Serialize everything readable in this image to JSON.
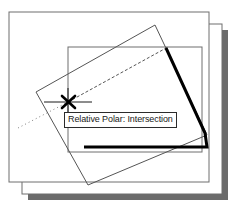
{
  "app": {
    "type": "cad-drawing-canvas",
    "background_color": "#ffffff"
  },
  "tooltip": {
    "text": "Relative Polar: Intersection",
    "border_color": "#2b2b2b",
    "background_color": "#ffffff",
    "text_color": "#1a1a1a"
  },
  "colors": {
    "paper_fill": "#ffffff",
    "paper_border": "#6e6e6e",
    "shadow": "#6b6b6b",
    "geometry_line": "#555555",
    "highlight_line": "#000000",
    "marker": "#000000",
    "tracking_line": "#808080"
  },
  "pages": [
    {
      "name": "back-sheet",
      "x": 22,
      "y": 24,
      "width": 200,
      "height": 170
    },
    {
      "name": "front-sheet",
      "x": 9,
      "y": 12,
      "width": 200,
      "height": 170
    }
  ],
  "shadow": {
    "name": "paper-drop-shadow",
    "offset_x": 6,
    "offset_y": 6
  },
  "shapes": [
    {
      "name": "axis-aligned-rectangle",
      "type": "rectangle",
      "x": 68,
      "y": 47,
      "width": 134,
      "height": 105,
      "stroke": "#6e6e6e",
      "stroke_width": 1
    },
    {
      "name": "rotated-rectangle",
      "type": "polygon",
      "points": "36,92 155,25 207,135 88,185",
      "stroke": "#555555",
      "stroke_width": 1
    }
  ],
  "highlight": {
    "name": "selected-edge-highlight",
    "points": "166,48 205,133 207,147 84,147",
    "stroke": "#000000",
    "stroke_width": 3
  },
  "marker": {
    "name": "intersection-snap-marker",
    "glyph": "x-cross",
    "x": 68,
    "y": 102,
    "size": 7,
    "stroke_width": 2.4
  },
  "tracking": {
    "horizontal_line": {
      "name": "horizontal-tracking-line",
      "x1": 44,
      "y1": 102,
      "x2": 92,
      "y2": 102
    },
    "vertical_line": {
      "name": "vertical-tracking-line",
      "x1": 68,
      "y1": 88,
      "x2": 68,
      "y2": 118
    },
    "polar_dotted_line": {
      "name": "polar-alignment-dotted-line",
      "x1": 18,
      "y1": 128,
      "x2": 68,
      "y2": 102,
      "dash": "1,3"
    },
    "polar_dashed_line": {
      "name": "polar-alignment-dashed-line",
      "x1": 68,
      "y1": 102,
      "x2": 168,
      "y2": 47,
      "dash": "3,2"
    }
  }
}
